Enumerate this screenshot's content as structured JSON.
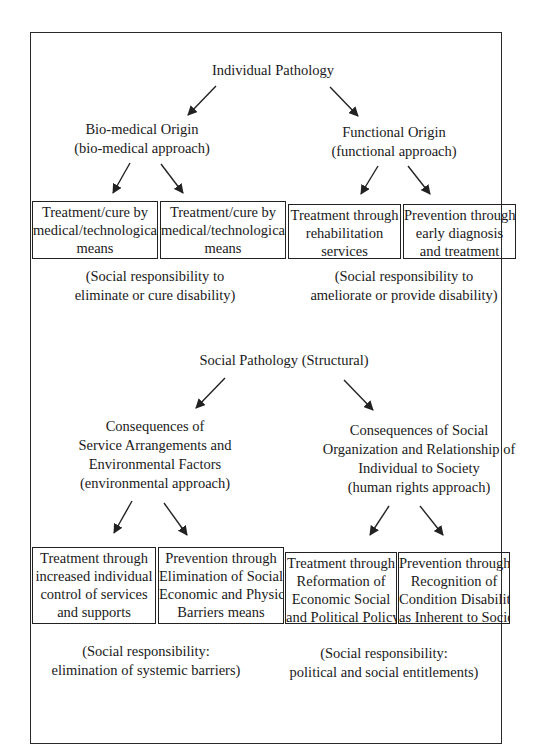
{
  "diagram": {
    "section1": {
      "root": "Individual Pathology",
      "left_branch": {
        "lines": [
          "Bio-medical Origin",
          "(bio-medical approach)"
        ],
        "boxes": [
          {
            "lines": [
              "Treatment/cure by",
              "medical/technological",
              "means"
            ]
          },
          {
            "lines": [
              "Treatment/cure by",
              "medical/technological",
              "means"
            ]
          }
        ],
        "note": [
          "(Social responsibility to",
          "eliminate or cure disability)"
        ]
      },
      "right_branch": {
        "lines": [
          "Functional Origin",
          "(functional approach)"
        ],
        "boxes": [
          {
            "lines": [
              "Treatment through",
              "rehabilitation",
              "services"
            ]
          },
          {
            "lines": [
              "Prevention through",
              "early diagnosis",
              "and treatment"
            ]
          }
        ],
        "note": [
          "(Social responsibility to",
          "ameliorate or provide disability)"
        ]
      }
    },
    "section2": {
      "root": "Social Pathology (Structural)",
      "left_branch": {
        "lines": [
          "Consequences of",
          "Service Arrangements and",
          "Environmental Factors",
          "(environmental approach)"
        ],
        "boxes": [
          {
            "lines": [
              "Treatment through",
              "increased individual",
              "control of services",
              "and supports"
            ]
          },
          {
            "lines": [
              "Prevention through",
              "Elimination of Social",
              "Economic and Physical",
              "Barriers means"
            ]
          }
        ],
        "note": [
          "(Social responsibility:",
          "elimination of systemic barriers)"
        ]
      },
      "right_branch": {
        "lines": [
          "Consequences of Social",
          "Organization and Relationship of",
          "Individual to Society",
          "(human rights approach)"
        ],
        "boxes": [
          {
            "lines": [
              "Treatment through",
              "Reformation of",
              "Economic Social",
              "and Political Policy"
            ]
          },
          {
            "lines": [
              "Prevention through",
              "Recognition of",
              "Condition Disability",
              "as Inherent to Society"
            ]
          }
        ],
        "note": [
          "(Social responsibility:",
          "political and social entitlements)"
        ]
      }
    }
  }
}
